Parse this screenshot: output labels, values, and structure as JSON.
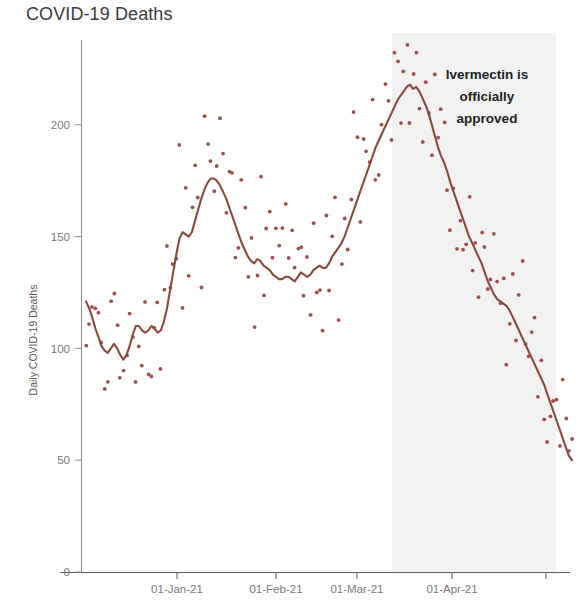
{
  "chart_data": {
    "type": "line",
    "title": "COVID-19 Deaths",
    "subtitle": "",
    "xlabel": "",
    "ylabel": "Daily COVID-19 Deaths",
    "xlim": [
      "2020-12-01",
      "2021-05-01"
    ],
    "ylim": [
      0,
      240
    ],
    "y_ticks": [
      0,
      50,
      100,
      150,
      200
    ],
    "y_tick_labels": [
      "0",
      "50",
      "100",
      "150",
      "200"
    ],
    "x_ticks": [
      "01-Jan-21",
      "01-Feb-21",
      "01-Mar-21",
      "01-Apr-21"
    ],
    "x_tick_labels": [
      "01-Jan-21",
      "01-Feb-21",
      "01-Mar-21",
      "01-Apr-21"
    ],
    "grid": false,
    "legend": "none",
    "colors": {
      "line": "#8a4a3e",
      "points": "#a0504a",
      "shaded_band": "#f2f2f2",
      "axis": "#7a7a7a",
      "title_text": "#3b3b3b",
      "annotation_text": "#232323"
    },
    "annotations": [
      {
        "name": "ivermectin-approval-note",
        "lines": [
          "Ivermectin is",
          "officially",
          "approved"
        ],
        "text": "Ivermectin is officially approved",
        "x": "2021-03-20",
        "align": "center"
      },
      {
        "name": "approval-shaded-region",
        "label": "shaded region after approval",
        "x_start": "2021-03-07",
        "x_end": "2021-05-01"
      }
    ],
    "series": [
      {
        "name": "7-day rolling average",
        "type": "line",
        "color": "#8a4a3e",
        "values": [
          121,
          118,
          114,
          109,
          105,
          101,
          99,
          98,
          100,
          102,
          100,
          97,
          95,
          97,
          101,
          106,
          110,
          110,
          108,
          107,
          108,
          110,
          109,
          107,
          108,
          112,
          118,
          126,
          134,
          142,
          149,
          152,
          151,
          150,
          152,
          157,
          162,
          167,
          171,
          174,
          176,
          176,
          175,
          173,
          170,
          167,
          163,
          159,
          155,
          151,
          147,
          144,
          141,
          139,
          138,
          140,
          139,
          137,
          136,
          135,
          133,
          132,
          131,
          131,
          132,
          132,
          131,
          130,
          132,
          134,
          133,
          132,
          133,
          135,
          136,
          137,
          136,
          136,
          138,
          141,
          143,
          145,
          147,
          150,
          154,
          158,
          162,
          166,
          170,
          174,
          178,
          182,
          186,
          190,
          193,
          196,
          199,
          202,
          205,
          208,
          211,
          213,
          215,
          217,
          218,
          216,
          217,
          215,
          212,
          209,
          205,
          200,
          195,
          190,
          186,
          183,
          179,
          174,
          170,
          166,
          162,
          158,
          154,
          150,
          147,
          144,
          141,
          138,
          134,
          130,
          127,
          124,
          122,
          121,
          120,
          119,
          117,
          114,
          111,
          108,
          105,
          102,
          99,
          96,
          93,
          90,
          87,
          84,
          80,
          76,
          72,
          68,
          64,
          60,
          56,
          52,
          50
        ]
      },
      {
        "name": "daily reported deaths",
        "type": "scatter",
        "color": "#a0504a",
        "approx_range": [
          20,
          238
        ],
        "note": "daily values scattered around the rolling average"
      }
    ],
    "peaks": [
      {
        "label": "January peak",
        "x": "01-Jan-21",
        "value": 176
      },
      {
        "label": "March peak",
        "x": "12-Mar-21",
        "value": 218
      }
    ],
    "end_value": 50
  },
  "footer": {
    "clipped_text": ""
  }
}
